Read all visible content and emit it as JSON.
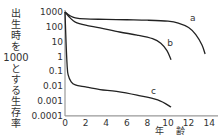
{
  "chart_data": {
    "type": "line",
    "title": "",
    "xlabel": [
      "年",
      "齢"
    ],
    "ylabel_parts": [
      "出",
      "生",
      "時",
      "を",
      "1000",
      "と",
      "す",
      "る",
      "生",
      "存",
      "率"
    ],
    "yscale": "log",
    "ylim": [
      0.0001,
      1000
    ],
    "xlim": [
      0,
      14.8
    ],
    "xticks": [
      "0",
      "2",
      "4",
      "6",
      "8",
      "10",
      "12",
      "14"
    ],
    "xtick_values": [
      0,
      2,
      4,
      6,
      8,
      10,
      12,
      14
    ],
    "yticks": [
      "1000",
      "100",
      "10",
      "1",
      "0.1",
      "0.01",
      "0.001",
      "0.0001"
    ],
    "ytick_values": [
      1000,
      100,
      10,
      1,
      0.1,
      0.01,
      0.001,
      0.0001
    ],
    "grid": false,
    "series": [
      {
        "name": "a",
        "x": [
          0,
          0.5,
          1,
          2,
          4,
          6,
          8,
          10,
          11,
          12,
          12.7,
          13.3,
          13.6
        ],
        "y": [
          1000,
          550,
          400,
          340,
          320,
          300,
          280,
          240,
          180,
          90,
          30,
          6,
          1.5
        ]
      },
      {
        "name": "b",
        "x": [
          0,
          0.5,
          1,
          2,
          3.4,
          5.3,
          7,
          8.5,
          9.3,
          9.9,
          10.3
        ],
        "y": [
          1000,
          400,
          210,
          130,
          85,
          45,
          28,
          16,
          8,
          2.5,
          0.6
        ]
      },
      {
        "name": "c",
        "x": [
          0,
          0.1,
          0.2,
          0.3,
          0.6,
          1,
          2,
          3.4,
          5,
          7,
          9,
          10.3
        ],
        "y": [
          1000,
          10,
          0.3,
          0.06,
          0.02,
          0.0125,
          0.009,
          0.006,
          0.0045,
          0.0025,
          0.0012,
          0.0004
        ]
      }
    ],
    "annotations": [
      {
        "text": "a",
        "series": "a",
        "x": 12.4,
        "y": 400
      },
      {
        "text": "b",
        "series": "b",
        "x": 10.2,
        "y": 8
      },
      {
        "text": "c",
        "series": "c",
        "x": 8.6,
        "y": 0.0045
      }
    ]
  }
}
